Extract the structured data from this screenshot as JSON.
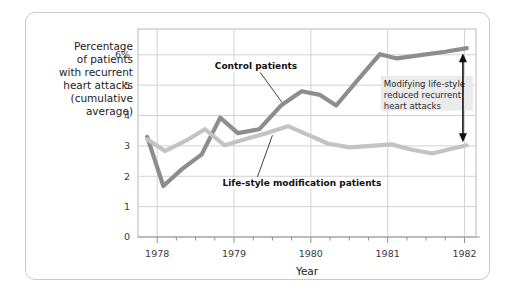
{
  "chart_data": {
    "type": "line",
    "title": "",
    "xlabel": "Year",
    "ylabel": "Percentage of patients with recurrent heart attacks (cumulative average)",
    "ylabel_lines": [
      "Percentage",
      "of patients",
      "with recurrent",
      "heart attacks",
      "(cumulative",
      "average)"
    ],
    "xlim": [
      1977.75,
      1982.15
    ],
    "ylim": [
      0,
      6.85
    ],
    "yticks": [
      0,
      1,
      2,
      3,
      4,
      5,
      6
    ],
    "ytick_labels": [
      "0",
      "1",
      "2",
      "3",
      "4",
      "5",
      "6%"
    ],
    "xticks": [
      1978,
      1979,
      1980,
      1981,
      1982
    ],
    "xtick_labels": [
      "1978",
      "1979",
      "1980",
      "1981",
      "1982"
    ],
    "minor_xticks_per_year": 4,
    "grid": true,
    "legend": "inline-annotations",
    "series": [
      {
        "name": "Control patients",
        "color": "#8d8d8d",
        "x": [
          1977.87,
          1978.08,
          1978.33,
          1978.58,
          1978.82,
          1979.05,
          1979.33,
          1979.62,
          1979.88,
          1980.12,
          1980.33,
          1980.62,
          1980.9,
          1981.12,
          1981.45,
          1981.75,
          1982.03
        ],
        "y": [
          3.3,
          1.68,
          2.25,
          2.72,
          3.93,
          3.42,
          3.55,
          4.35,
          4.8,
          4.68,
          4.33,
          5.2,
          6.02,
          5.88,
          6.0,
          6.1,
          6.22
        ]
      },
      {
        "name": "Life-style modification patients",
        "color": "#c3c3c3",
        "x": [
          1977.87,
          1978.1,
          1978.38,
          1978.62,
          1978.88,
          1979.12,
          1979.42,
          1979.7,
          1979.95,
          1980.22,
          1980.5,
          1980.78,
          1981.05,
          1981.3,
          1981.58,
          1981.82,
          1982.03
        ],
        "y": [
          3.22,
          2.83,
          3.18,
          3.55,
          3.02,
          3.2,
          3.42,
          3.65,
          3.38,
          3.08,
          2.95,
          3.0,
          3.05,
          2.88,
          2.75,
          2.9,
          3.02
        ]
      }
    ],
    "annotations": [
      {
        "name": "control-patients-callout",
        "text": "Control patients",
        "text_x": 1978.75,
        "text_y": 5.62,
        "leader_to_x": 1979.62,
        "leader_to_y": 4.45
      },
      {
        "name": "lifestyle-patients-callout",
        "text": "Life-style modification patients",
        "text_x": 1978.85,
        "text_y": 1.78,
        "leader_to_x": 1979.5,
        "leader_to_y": 3.35
      },
      {
        "name": "gap-annotation",
        "lines": [
          "Modifying life-style",
          "reduced recurrent",
          "heart attacks"
        ],
        "text_x": 1980.95,
        "text_y": 4.95,
        "arrow_x": 1981.98,
        "arrow_top_y": 6.05,
        "arrow_bottom_y": 3.12
      }
    ]
  }
}
